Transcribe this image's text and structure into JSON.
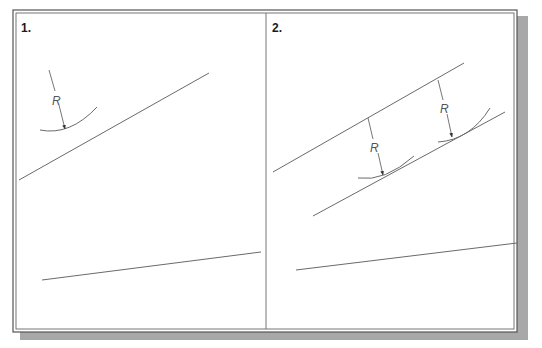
{
  "figure": {
    "panels": [
      {
        "label": "1.",
        "radius_labels": [
          "R"
        ],
        "description": "Arc of radius R offset toward a line"
      },
      {
        "label": "2.",
        "radius_labels": [
          "R",
          "R"
        ],
        "description": "Parallel line drawn at distance R using two arcs"
      }
    ]
  },
  "colors": {
    "frame": "#555555",
    "shadow": "#a8a8a8",
    "line": "#6a6a6a",
    "text": "#1a1a1a"
  }
}
